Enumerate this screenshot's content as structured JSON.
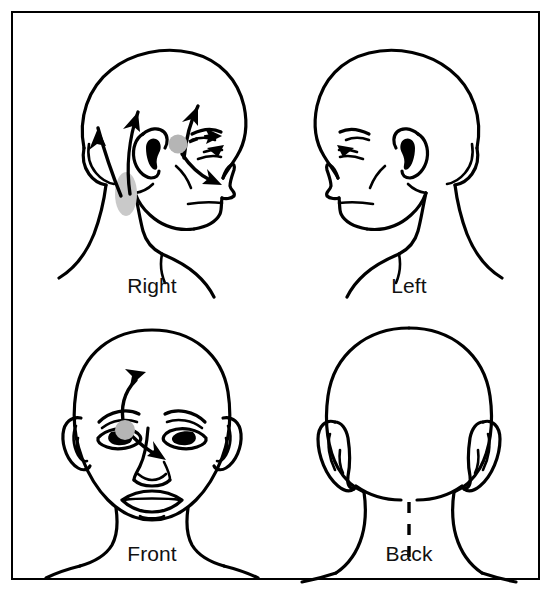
{
  "figure": {
    "title_visible": false,
    "border_color": "#000000",
    "background_color": "#ffffff",
    "ink_color": "#000000",
    "marker_color": "#b5b5b5",
    "marker_color_light": "#c9c9c9"
  },
  "panels": [
    {
      "id": "right",
      "label": "Right",
      "view": "right-lateral-head-profile",
      "facing": "right",
      "has_arrows": true,
      "has_markers": true,
      "markers": [
        {
          "name": "trigger-point-preauricular",
          "shape": "circle",
          "cx": 152,
          "cy": 118,
          "r": 9.5,
          "color": "#b5b5b5"
        },
        {
          "name": "referral-zone-upper-neck",
          "shape": "ellipse",
          "cx": 100,
          "cy": 168,
          "rx": 11,
          "ry": 22,
          "color": "#c9c9c9"
        }
      ],
      "arrows": [
        {
          "name": "arrow-occipital-outer-up",
          "style": "solid",
          "direction": "up"
        },
        {
          "name": "arrow-occipital-inner-up",
          "style": "solid",
          "direction": "up"
        },
        {
          "name": "arrow-temporal-up",
          "style": "solid",
          "direction": "up"
        },
        {
          "name": "arrow-to-eye",
          "style": "dashed",
          "direction": "right-up"
        },
        {
          "name": "arrow-to-cheek",
          "style": "solid",
          "direction": "right-down"
        }
      ]
    },
    {
      "id": "left",
      "label": "Left",
      "view": "left-lateral-head-profile",
      "facing": "left",
      "has_arrows": false,
      "has_markers": false,
      "markers": [],
      "arrows": []
    },
    {
      "id": "front",
      "label": "Front",
      "view": "anterior-head-face",
      "facing": "front",
      "has_arrows": true,
      "has_markers": true,
      "markers": [
        {
          "name": "trigger-point-preauricular",
          "shape": "circle",
          "cx": 99,
          "cy": 120,
          "r": 10,
          "color": "#b5b5b5"
        }
      ],
      "arrows": [
        {
          "name": "arrow-to-forehead",
          "style": "solid",
          "direction": "up-right"
        },
        {
          "name": "arrow-to-cheek",
          "style": "solid",
          "direction": "down-right"
        }
      ]
    },
    {
      "id": "back",
      "label": "Back",
      "view": "posterior-head-neck",
      "facing": "back",
      "has_arrows": false,
      "has_markers": false,
      "markers": [],
      "arrows": [],
      "midline": {
        "name": "cervical-midline",
        "style": "dashed"
      }
    }
  ]
}
